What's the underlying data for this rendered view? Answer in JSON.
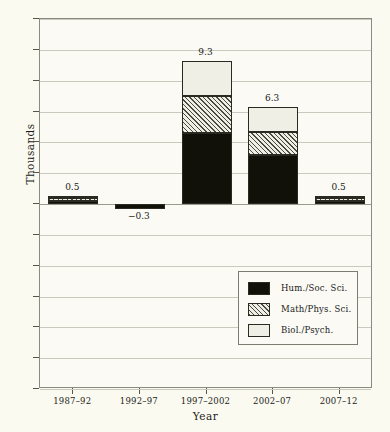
{
  "chart_data": {
    "type": "bar",
    "stacked": true,
    "title": "",
    "xlabel": "Year",
    "ylabel": "Thousands",
    "categories": [
      "1987–92",
      "1992–97",
      "1997–2002",
      "2002–07",
      "2007–12"
    ],
    "series": [
      {
        "name": "Hum./Soc. Sci.",
        "values": [
          0.2,
          -0.3,
          4.6,
          3.2,
          0.2
        ]
      },
      {
        "name": "Math/Phys. Sci.",
        "values": [
          0.2,
          0.0,
          2.4,
          1.5,
          0.2
        ]
      },
      {
        "name": "Biol./Psych.",
        "values": [
          0.1,
          0.0,
          2.3,
          1.6,
          0.1
        ]
      }
    ],
    "totals": [
      0.5,
      -0.3,
      9.3,
      6.3,
      0.5
    ],
    "total_labels": [
      "0.5",
      "−0.3",
      "9.3",
      "6.3",
      "0.5"
    ],
    "ylim": [
      -12,
      12
    ],
    "yticks": [
      12,
      10,
      8,
      6,
      4,
      2,
      0,
      -2,
      -4,
      -6,
      -8,
      -10,
      -12
    ],
    "ytick_labels": [
      "12",
      "10",
      "8",
      "6",
      "4",
      "2",
      "0",
      "−2",
      "−4",
      "−6",
      "−8",
      "−10",
      "−12"
    ],
    "grid": true,
    "legend_position": "lower-right",
    "legend": [
      {
        "label": "Hum./Soc. Sci.",
        "pattern": "solid-black",
        "color": "#111109"
      },
      {
        "label": "Math/Phys. Sci.",
        "pattern": "diagonal-hatch",
        "color": "#efeee4"
      },
      {
        "label": "Biol./Psych.",
        "pattern": "solid-light",
        "color": "#f0efe6"
      }
    ]
  }
}
